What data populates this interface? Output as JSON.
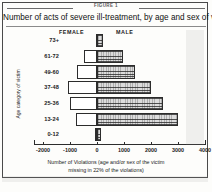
{
  "figure": {
    "number_label": "FIGURE 1",
    "title": "Number of acts of severe ill-treatment, by age and sex of victim",
    "caption_line1": "Number of Violations (age and/or sex of the victim",
    "caption_line2": "missing in 22% of the violations)"
  },
  "axes": {
    "y_axis_label": "Age category of victim",
    "x_axis_label": "Number of Violations"
  },
  "legend": {
    "female": "FEMALE",
    "male": "MALE"
  },
  "colors": {
    "female_fill": "#ffffff",
    "male_fill": "#dcdcdc",
    "outline": "#2c2c2c",
    "frame": "#4a4a4a"
  },
  "chart_data": {
    "type": "bar",
    "subtype": "population-pyramid",
    "title": "Number of acts of severe ill-treatment, by age and sex of victim",
    "xlabel": "Number of Violations (age and/or sex of the victim missing in 22% of the violations)",
    "ylabel": "Age category of victim",
    "categories": [
      "73+",
      "61-72",
      "49-60",
      "37-48",
      "25-36",
      "13-24",
      "0-12"
    ],
    "tick_labels": [
      "-2000",
      "-1000",
      "0",
      "1000",
      "2000",
      "3000",
      "4000"
    ],
    "tick_values": [
      -2000,
      -1000,
      0,
      1000,
      2000,
      3000,
      4000
    ],
    "xlim": [
      -2300,
      3850
    ],
    "grid": false,
    "legend_position": "top-inside",
    "series": [
      {
        "name": "FEMALE",
        "values": [
          -40,
          -480,
          -750,
          -1080,
          -1000,
          -790,
          -60
        ],
        "note": "plotted to the left of zero"
      },
      {
        "name": "MALE",
        "values": [
          210,
          950,
          1400,
          2000,
          2450,
          3000,
          140
        ],
        "note": "plotted to the right of zero"
      }
    ]
  }
}
